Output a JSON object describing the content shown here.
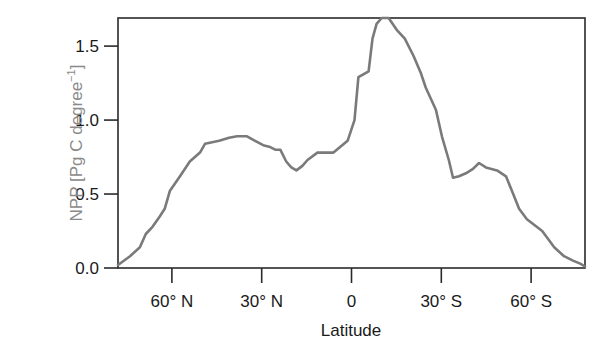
{
  "chart_data": {
    "type": "line",
    "title": "",
    "xlabel": "Latitude",
    "ylabel": "NPP [Pg C degree⁻¹]",
    "ylabel_main": "NPP [Pg C degree",
    "ylabel_sup": "−1",
    "xlim": [
      78,
      -78
    ],
    "ylim": [
      0.0,
      1.69
    ],
    "grid": false,
    "legend": null,
    "x_axis_note": "Latitude in degrees; positive = North, negative = South",
    "x_ticks": [
      {
        "value": 60,
        "label": "60° N"
      },
      {
        "value": 30,
        "label": "30° N"
      },
      {
        "value": 0,
        "label": "0"
      },
      {
        "value": -30,
        "label": "30° S"
      },
      {
        "value": -60,
        "label": "60° S"
      }
    ],
    "y_ticks": [
      {
        "value": 0.0,
        "label": "0.0"
      },
      {
        "value": 0.5,
        "label": "0.5"
      },
      {
        "value": 1.0,
        "label": "1.0"
      },
      {
        "value": 1.5,
        "label": "1.5"
      }
    ],
    "series": [
      {
        "name": "NPP",
        "color": "#7a7a7a",
        "x": [
          78.0,
          74.0,
          70.7,
          68.7,
          66.4,
          64.0,
          62.4,
          60.7,
          57.3,
          54.0,
          50.6,
          48.9,
          44.2,
          40.9,
          38.2,
          34.9,
          32.2,
          29.5,
          27.5,
          25.5,
          23.8,
          21.8,
          20.1,
          18.4,
          16.4,
          14.7,
          11.4,
          8.4,
          6.0,
          3.7,
          1.3,
          -1.0,
          -2.3,
          -5.7,
          -7.0,
          -8.4,
          -10.1,
          -12.4,
          -15.1,
          -17.8,
          -20.8,
          -23.1,
          -24.8,
          -28.2,
          -30.2,
          -32.5,
          -33.9,
          -35.9,
          -38.2,
          -40.6,
          -42.6,
          -44.9,
          -48.6,
          -51.6,
          -53.6,
          -56.0,
          -58.6,
          -63.7,
          -67.7,
          -71.0,
          -74.0,
          -76.4,
          -78.0
        ],
        "y": [
          0.02,
          0.08,
          0.14,
          0.23,
          0.28,
          0.35,
          0.4,
          0.52,
          0.62,
          0.72,
          0.78,
          0.84,
          0.86,
          0.88,
          0.89,
          0.89,
          0.86,
          0.83,
          0.82,
          0.8,
          0.8,
          0.72,
          0.68,
          0.66,
          0.69,
          0.73,
          0.78,
          0.78,
          0.78,
          0.82,
          0.86,
          1.0,
          1.29,
          1.33,
          1.55,
          1.65,
          1.69,
          1.69,
          1.61,
          1.55,
          1.43,
          1.32,
          1.22,
          1.07,
          0.89,
          0.73,
          0.61,
          0.62,
          0.64,
          0.67,
          0.71,
          0.68,
          0.66,
          0.62,
          0.52,
          0.4,
          0.33,
          0.25,
          0.14,
          0.08,
          0.05,
          0.03,
          0.01
        ]
      }
    ]
  }
}
